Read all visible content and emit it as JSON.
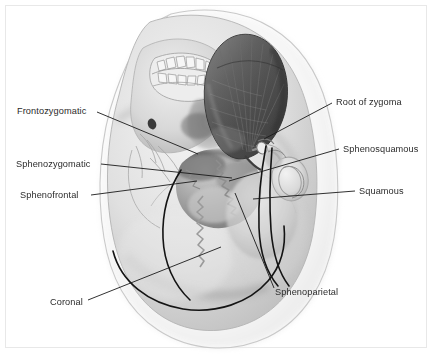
{
  "figure": {
    "kind": "anatomical-illustration",
    "width": 433,
    "height": 354,
    "background_color": "#ffffff",
    "frame_color": "#e8e8e8",
    "label_color": "#2b2b2b",
    "leader_color": "#1a1a1a",
    "suture_color": "#141414"
  },
  "labels": [
    {
      "id": "frontozygomatic",
      "text": "Frontozygomatic",
      "side": "left",
      "x": 17,
      "y": 106,
      "leader": "M 97,112 L 198,154"
    },
    {
      "id": "sphenozygomatic",
      "text": "Sphenozygomatic",
      "side": "left",
      "x": 16,
      "y": 159,
      "leader": "M 101,164 L 232,178"
    },
    {
      "id": "sphenofrontal",
      "text": "Sphenofrontal",
      "side": "left",
      "x": 20,
      "y": 190,
      "leader": "M 91,195 L 197,181"
    },
    {
      "id": "coronal",
      "text": "Coronal",
      "side": "left",
      "x": 50,
      "y": 297,
      "leader": "M 88,300 L 221,247"
    },
    {
      "id": "root-of-zygoma",
      "text": "Root of zygoma",
      "side": "right",
      "x": 336,
      "y": 97,
      "leader": "M 332,103 L 264,139"
    },
    {
      "id": "sphenosquamous",
      "text": "Sphenosquamous",
      "side": "right",
      "x": 343,
      "y": 144,
      "leader": "M 339,149 L 229,181"
    },
    {
      "id": "squamous",
      "text": "Squamous",
      "side": "right",
      "x": 359,
      "y": 186,
      "leader": "M 355,191 L 253,199"
    },
    {
      "id": "sphenoparietal",
      "text": "Sphenoparietal",
      "side": "right",
      "x": 275,
      "y": 287,
      "leader": "M 274,288 L 235,193"
    }
  ],
  "anatomy": {
    "head_outline": "head-soft-tissue-outline",
    "skull": "skull-lateral",
    "temporalis_muscle": "temporalis-muscle",
    "greater_wing_of_sphenoid": "greater-wing-sphenoid",
    "maxillary_teeth": "maxillary-teeth",
    "external_acoustic_meatus": "external-acoustic-meatus",
    "zygomatic_arch": "zygomatic-arch",
    "coronal_suture_line": "coronal-suture",
    "temporal_line": "temporal-line"
  },
  "palette": {
    "muscle_dark": "#4a4a4a",
    "muscle_mid": "#5e5e5e",
    "muscle_light": "#7a7a7a",
    "bone_light": "#e3e3e3",
    "bone_mid": "#cfcfcf",
    "bone_shadow": "#a9a9a9",
    "soft_tissue": "#f2f2f2",
    "outline": "#9a9a9a"
  }
}
